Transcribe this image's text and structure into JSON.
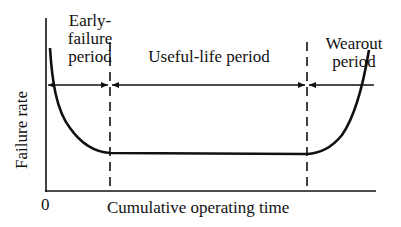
{
  "diagram": {
    "type": "bathtub-curve",
    "y_axis_label": "Failure rate",
    "x_axis_label": "Cumulative operating time",
    "origin_label": "0",
    "periods": [
      {
        "line1": "Early-",
        "line2": "failure",
        "line3": "period"
      },
      {
        "line1": "Useful-life period"
      },
      {
        "line1": "Wearout",
        "line2": "period"
      }
    ]
  }
}
